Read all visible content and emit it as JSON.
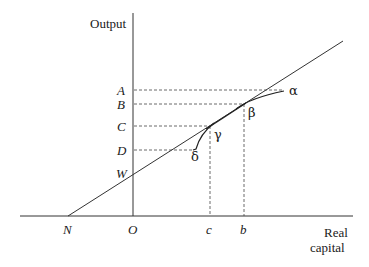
{
  "diagram": {
    "y_axis_label": "Output",
    "x_axis_label_line1": "Real",
    "x_axis_label_line2": "capital",
    "y_levels": [
      {
        "label": "A",
        "y": 90
      },
      {
        "label": "B",
        "y": 104
      },
      {
        "label": "C",
        "y": 126
      },
      {
        "label": "D",
        "y": 150
      },
      {
        "label": "W",
        "y": 173
      }
    ],
    "x_points": [
      {
        "label": "N",
        "x": 68
      },
      {
        "label": "O",
        "x": 133
      },
      {
        "label": "c",
        "x": 210
      },
      {
        "label": "b",
        "x": 244
      }
    ],
    "curve_points": [
      {
        "label": "α"
      },
      {
        "label": "β"
      },
      {
        "label": "γ"
      },
      {
        "label": "δ"
      }
    ],
    "colors": {
      "line": "#333333",
      "dash": "#444444",
      "background": "#ffffff"
    }
  }
}
